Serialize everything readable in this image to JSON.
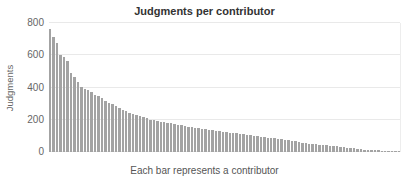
{
  "colors": {
    "bar": "#a3a3a3",
    "gridline": "#e9e9e9",
    "title_text": "#333333",
    "axis_text": "#666666"
  },
  "chart_data": {
    "type": "bar",
    "title": "Judgments per contributor",
    "ylabel": "Judgments",
    "xlabel": "Each bar represents a contributor",
    "ylim": [
      0,
      800
    ],
    "yticks": [
      0,
      200,
      400,
      600,
      800
    ],
    "grid": "horizontal",
    "legend": "none",
    "categories_note": "each bar is one anonymous contributor, unlabeled",
    "values": [
      760,
      715,
      675,
      600,
      590,
      565,
      490,
      465,
      435,
      405,
      390,
      385,
      370,
      352,
      345,
      332,
      315,
      302,
      295,
      285,
      272,
      262,
      252,
      243,
      235,
      228,
      222,
      215,
      208,
      200,
      196,
      192,
      188,
      184,
      180,
      177,
      174,
      170,
      166,
      162,
      158,
      155,
      152,
      148,
      145,
      142,
      139,
      136,
      133,
      130,
      127,
      124,
      121,
      118,
      115,
      112,
      110,
      107,
      104,
      101,
      98,
      95,
      93,
      90,
      88,
      85,
      82,
      79,
      76,
      73,
      70,
      66,
      62,
      58,
      55,
      52,
      50,
      48,
      46,
      44,
      42,
      40,
      38,
      35,
      32,
      30,
      28,
      25,
      22,
      20,
      18,
      15,
      13,
      12,
      10,
      10,
      9,
      9,
      8,
      8,
      8,
      8
    ]
  }
}
